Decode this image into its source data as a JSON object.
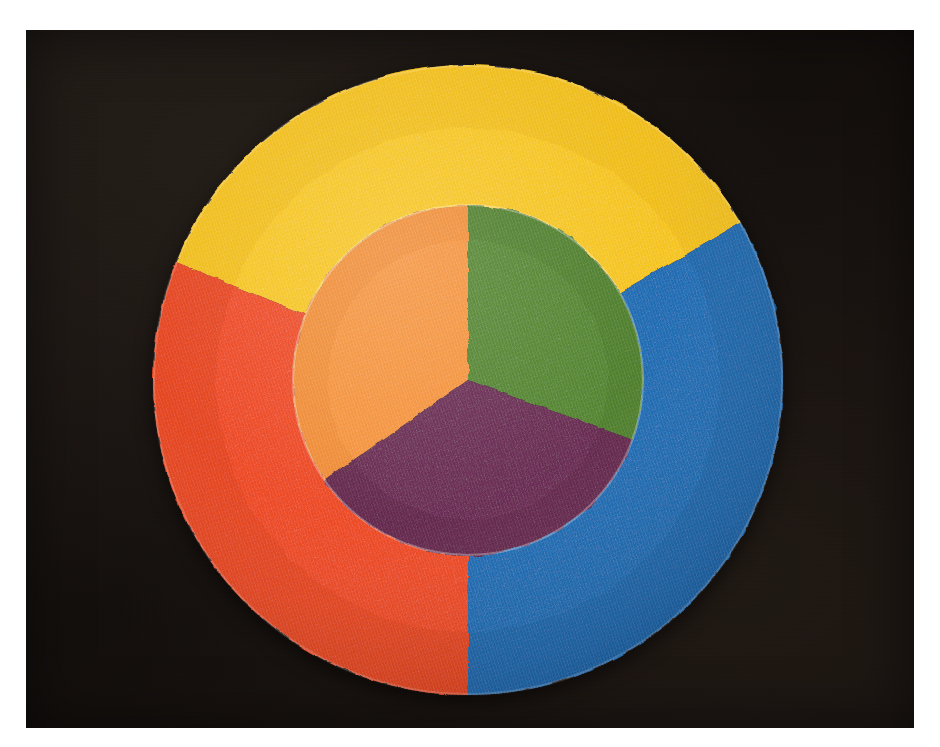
{
  "image": {
    "title": "Three-ring painted color wheel on black matte board",
    "medium": "painted paper disc photograph",
    "width": 940,
    "height": 747,
    "border_color": "#ffffff",
    "backdrop_color": "#161210",
    "backdrop_label": "black-matte-board"
  },
  "wheel": {
    "center_x": 468,
    "center_y": 380,
    "outer_radius": 315,
    "inner_radius": 175,
    "ring_label": "primary-colors-ring",
    "disc_label": "secondary-colors-disc"
  },
  "chart_data": {
    "type": "pie",
    "xlabel": "",
    "ylabel": "",
    "legend_position": "none",
    "grid": false,
    "rings": [
      {
        "name": "outer-ring",
        "label": "Primary colors",
        "inner_radius": 175,
        "outer_radius": 315,
        "slices": [
          {
            "label": "Yellow",
            "color": "#F7C61C",
            "shade_color": "#E3AE12",
            "start_angle_deg": 30,
            "end_angle_deg": 158,
            "sweep_deg": 128,
            "share_pct": 35.6,
            "position": "top"
          },
          {
            "label": "Red",
            "color": "#EE4923",
            "shade_color": "#D53A19",
            "start_angle_deg": 158,
            "end_angle_deg": 270,
            "sweep_deg": 112,
            "share_pct": 31.1,
            "position": "lower-left"
          },
          {
            "label": "Blue",
            "color": "#1E6CB4",
            "shade_color": "#175C9E",
            "start_angle_deg": -90,
            "end_angle_deg": 30,
            "sweep_deg": 120,
            "share_pct": 33.3,
            "position": "right"
          }
        ]
      },
      {
        "name": "inner-disc",
        "label": "Secondary colors",
        "inner_radius": 0,
        "outer_radius": 175,
        "slices": [
          {
            "label": "Orange",
            "color": "#F5943A",
            "shade_color": "#E5812A",
            "start_angle_deg": 90,
            "end_angle_deg": 215,
            "sweep_deg": 125,
            "share_pct": 34.7,
            "position": "upper-left"
          },
          {
            "label": "Green",
            "color": "#53862E",
            "shade_color": "#477526",
            "start_angle_deg": -20,
            "end_angle_deg": 90,
            "sweep_deg": 110,
            "share_pct": 30.6,
            "position": "upper-right"
          },
          {
            "label": "Purple",
            "color": "#6A2A53",
            "shade_color": "#592143",
            "start_angle_deg": 215,
            "end_angle_deg": 340,
            "sweep_deg": 125,
            "share_pct": 34.7,
            "position": "bottom"
          }
        ]
      }
    ]
  }
}
